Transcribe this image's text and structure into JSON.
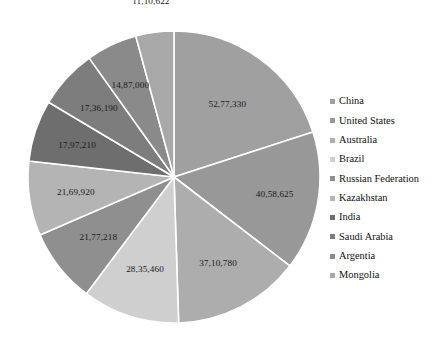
{
  "chart_data": {
    "type": "pie",
    "title": "",
    "legend_position": "right",
    "labels": [
      "China",
      "United States",
      "Australia",
      "Brazil",
      "Russian Federation",
      "Kazakhstan",
      "India",
      "Saudi Arabia",
      "Argentia",
      "Mongolia"
    ],
    "values": [
      5277330,
      4058625,
      3710780,
      2835460,
      2177218,
      2169920,
      1797210,
      1736190,
      1487000,
      1110622
    ],
    "value_labels": [
      "52,77,330",
      "40,58,625",
      "37,10,780",
      "28,35,460",
      "21,77,218",
      "21,69,920",
      "17,97,210",
      "17,36,190",
      "14,87,000",
      "11,10,622"
    ],
    "colors": [
      "#a0a0a0",
      "#989898",
      "#adadad",
      "#cfcfcf",
      "#8f8f8f",
      "#b4b4b4",
      "#6e6e6e",
      "#7d7d7d",
      "#8a8a8a",
      "#a8a8a8"
    ],
    "slice_border_color": "#ffffff",
    "label_color": "#1a1a1a"
  },
  "legend": {
    "items": [
      {
        "label": "China",
        "color": "#a0a0a0"
      },
      {
        "label": "United States",
        "color": "#989898"
      },
      {
        "label": "Australia",
        "color": "#adadad"
      },
      {
        "label": "Brazil",
        "color": "#cfcfcf"
      },
      {
        "label": "Russian Federation",
        "color": "#8f8f8f"
      },
      {
        "label": "Kazakhstan",
        "color": "#b4b4b4"
      },
      {
        "label": "India",
        "color": "#6e6e6e"
      },
      {
        "label": "Saudi Arabia",
        "color": "#7d7d7d"
      },
      {
        "label": "Argentia",
        "color": "#8a8a8a"
      },
      {
        "label": "Mongolia",
        "color": "#a8a8a8"
      }
    ]
  }
}
